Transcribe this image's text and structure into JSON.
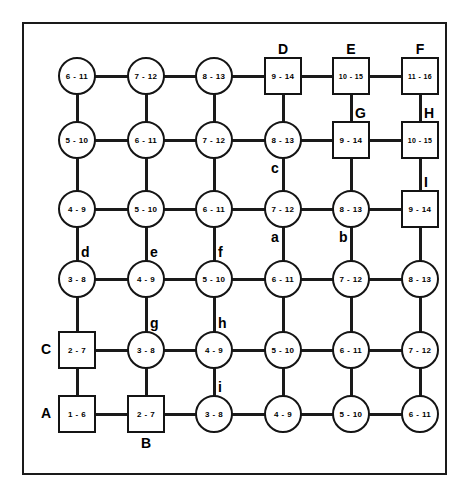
{
  "diagram": {
    "frame": {
      "stroke": "#1a1a1a"
    },
    "geometry": {
      "col_x": [
        75,
        144,
        212,
        281,
        349,
        418
      ],
      "row_y": [
        74,
        138,
        207,
        277,
        348,
        412
      ],
      "circle_radius": 19,
      "square_half": 19
    },
    "nodes": [
      {
        "id": "r0c0",
        "row": 0,
        "col": 0,
        "shape": "circle",
        "value": "6 - 11",
        "label": "",
        "label_pos": ""
      },
      {
        "id": "r0c1",
        "row": 0,
        "col": 1,
        "shape": "circle",
        "value": "7 - 12",
        "label": "",
        "label_pos": ""
      },
      {
        "id": "r0c2",
        "row": 0,
        "col": 2,
        "shape": "circle",
        "value": "8 - 13",
        "label": "",
        "label_pos": ""
      },
      {
        "id": "r0c3",
        "row": 0,
        "col": 3,
        "shape": "square",
        "value": "9 - 14",
        "label": "D",
        "label_pos": "top"
      },
      {
        "id": "r0c4",
        "row": 0,
        "col": 4,
        "shape": "square",
        "value": "10 - 15",
        "label": "E",
        "label_pos": "top"
      },
      {
        "id": "r0c5",
        "row": 0,
        "col": 5,
        "shape": "square",
        "value": "11 - 16",
        "label": "F",
        "label_pos": "top"
      },
      {
        "id": "r1c0",
        "row": 1,
        "col": 0,
        "shape": "circle",
        "value": "5 - 10",
        "label": "",
        "label_pos": ""
      },
      {
        "id": "r1c1",
        "row": 1,
        "col": 1,
        "shape": "circle",
        "value": "6 - 11",
        "label": "",
        "label_pos": ""
      },
      {
        "id": "r1c2",
        "row": 1,
        "col": 2,
        "shape": "circle",
        "value": "7 - 12",
        "label": "",
        "label_pos": ""
      },
      {
        "id": "r1c3",
        "row": 1,
        "col": 3,
        "shape": "circle",
        "value": "8 - 13",
        "label": "c",
        "label_pos": "bottom-left"
      },
      {
        "id": "r1c4",
        "row": 1,
        "col": 4,
        "shape": "square",
        "value": "9 - 14",
        "label": "G",
        "label_pos": "top-right"
      },
      {
        "id": "r1c5",
        "row": 1,
        "col": 5,
        "shape": "square",
        "value": "10 - 15",
        "label": "H",
        "label_pos": "top-right"
      },
      {
        "id": "r2c0",
        "row": 2,
        "col": 0,
        "shape": "circle",
        "value": "4 - 9",
        "label": "",
        "label_pos": ""
      },
      {
        "id": "r2c1",
        "row": 2,
        "col": 1,
        "shape": "circle",
        "value": "5 - 10",
        "label": "",
        "label_pos": ""
      },
      {
        "id": "r2c2",
        "row": 2,
        "col": 2,
        "shape": "circle",
        "value": "6 - 11",
        "label": "",
        "label_pos": ""
      },
      {
        "id": "r2c3",
        "row": 2,
        "col": 3,
        "shape": "circle",
        "value": "7 - 12",
        "label": "a",
        "label_pos": "bottom-left"
      },
      {
        "id": "r2c4",
        "row": 2,
        "col": 4,
        "shape": "circle",
        "value": "8 - 13",
        "label": "b",
        "label_pos": "bottom-left"
      },
      {
        "id": "r2c5",
        "row": 2,
        "col": 5,
        "shape": "square",
        "value": "9 - 14",
        "label": "I",
        "label_pos": "top-right"
      },
      {
        "id": "r3c0",
        "row": 3,
        "col": 0,
        "shape": "circle",
        "value": "3 - 8",
        "label": "d",
        "label_pos": "top-right"
      },
      {
        "id": "r3c1",
        "row": 3,
        "col": 1,
        "shape": "circle",
        "value": "4 - 9",
        "label": "e",
        "label_pos": "top-right"
      },
      {
        "id": "r3c2",
        "row": 3,
        "col": 2,
        "shape": "circle",
        "value": "5 - 10",
        "label": "f",
        "label_pos": "top-right"
      },
      {
        "id": "r3c3",
        "row": 3,
        "col": 3,
        "shape": "circle",
        "value": "6 - 11",
        "label": "",
        "label_pos": ""
      },
      {
        "id": "r3c4",
        "row": 3,
        "col": 4,
        "shape": "circle",
        "value": "7 - 12",
        "label": "",
        "label_pos": ""
      },
      {
        "id": "r3c5",
        "row": 3,
        "col": 5,
        "shape": "circle",
        "value": "8 - 13",
        "label": "",
        "label_pos": ""
      },
      {
        "id": "r4c0",
        "row": 4,
        "col": 0,
        "shape": "square",
        "value": "2 - 7",
        "label": "C",
        "label_pos": "left"
      },
      {
        "id": "r4c1",
        "row": 4,
        "col": 1,
        "shape": "circle",
        "value": "3 - 8",
        "label": "g",
        "label_pos": "top-right"
      },
      {
        "id": "r4c2",
        "row": 4,
        "col": 2,
        "shape": "circle",
        "value": "4 - 9",
        "label": "h",
        "label_pos": "top-right"
      },
      {
        "id": "r4c3",
        "row": 4,
        "col": 3,
        "shape": "circle",
        "value": "5 - 10",
        "label": "",
        "label_pos": ""
      },
      {
        "id": "r4c4",
        "row": 4,
        "col": 4,
        "shape": "circle",
        "value": "6 - 11",
        "label": "",
        "label_pos": ""
      },
      {
        "id": "r4c5",
        "row": 4,
        "col": 5,
        "shape": "circle",
        "value": "7 - 12",
        "label": "",
        "label_pos": ""
      },
      {
        "id": "r5c0",
        "row": 5,
        "col": 0,
        "shape": "square",
        "value": "1 - 6",
        "label": "A",
        "label_pos": "left"
      },
      {
        "id": "r5c1",
        "row": 5,
        "col": 1,
        "shape": "square",
        "value": "2 - 7",
        "label": "B",
        "label_pos": "bottom"
      },
      {
        "id": "r5c2",
        "row": 5,
        "col": 2,
        "shape": "circle",
        "value": "3 - 8",
        "label": "i",
        "label_pos": "top-right"
      },
      {
        "id": "r5c3",
        "row": 5,
        "col": 3,
        "shape": "circle",
        "value": "4 - 9",
        "label": "",
        "label_pos": ""
      },
      {
        "id": "r5c4",
        "row": 5,
        "col": 4,
        "shape": "circle",
        "value": "5 - 10",
        "label": "",
        "label_pos": ""
      },
      {
        "id": "r5c5",
        "row": 5,
        "col": 5,
        "shape": "circle",
        "value": "6 - 11",
        "label": "",
        "label_pos": ""
      }
    ],
    "edges_note": "Full 6x6 lattice: every node connects to its horizontal and vertical neighbours."
  }
}
